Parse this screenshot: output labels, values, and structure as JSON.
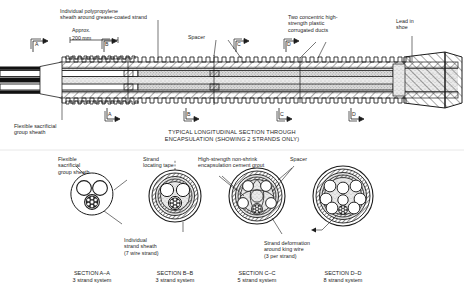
{
  "figure": {
    "title_line1": "TYPICAL LONGITUDINAL SECTION THROUGH",
    "title_line2": "ENCAPSULATION (SHOWING 2 STRANDS ONLY)"
  },
  "dimension": {
    "approx": "Approx.",
    "value": "200 mm"
  },
  "callouts_top": [
    {
      "id": "individual-polypropylene-sheath",
      "line1": "Individual polypropylene",
      "line2": "sheath around grease-coated strand"
    },
    {
      "id": "spacer",
      "line1": "Spacer",
      "line2": ""
    },
    {
      "id": "concentric-ducts",
      "line1": "Two concentric high-",
      "line2": "strength plastic",
      "line3": "corrugated ducts"
    },
    {
      "id": "lead-in-shoe",
      "line1": "Lead in",
      "line2": "shoe"
    }
  ],
  "callouts_bottom": [
    {
      "id": "flexible-sacrificial-group-sheath",
      "line1": "Flexible sacrificial",
      "line2": "group sheath"
    }
  ],
  "section_markers": [
    {
      "id": "A",
      "label": "A"
    },
    {
      "id": "B",
      "label": "B"
    },
    {
      "id": "C",
      "label": "C"
    },
    {
      "id": "D",
      "label": "D"
    }
  ],
  "detail_callouts": [
    {
      "id": "flexible-sacrificial-group-sheath-detail",
      "line1": "Flexible",
      "line2": "sacrificial",
      "line3": "group sheath"
    },
    {
      "id": "strand-locating-tape",
      "line1": "Strand",
      "line2": "locating tape",
      "line3": ""
    },
    {
      "id": "encapsulation-cement-grout",
      "line1": "High-strength non-shrink",
      "line2": "encapsulation cement grout",
      "line3": ""
    },
    {
      "id": "spacer-detail",
      "line1": "Spacer",
      "line2": "",
      "line3": ""
    },
    {
      "id": "individual-strand-sheath",
      "line1": "Individual",
      "line2": "strand sheath",
      "line3": "(7 wire strand)"
    },
    {
      "id": "strand-deformation",
      "line1": "Strand deformation",
      "line2": "around king wire",
      "line3": "(3 per strand)"
    }
  ],
  "sections": [
    {
      "id": "section-a-a",
      "name": "SECTION A–A",
      "system": "3 strand system",
      "strands": 3,
      "cx": 92,
      "r": 21
    },
    {
      "id": "section-b-b",
      "name": "SECTION B–B",
      "system": "3 strand system",
      "strands": 3,
      "cx": 175,
      "r": 26
    },
    {
      "id": "section-c-c",
      "name": "SECTION C–C",
      "system": "5 strand system",
      "strands": 5,
      "cx": 257,
      "r": 28
    },
    {
      "id": "section-d-d",
      "name": "SECTION D–D",
      "system": "8 strand system",
      "strands": 8,
      "cx": 343,
      "r": 30
    }
  ],
  "colors": {
    "ink": "#1c1c1c",
    "paper": "#ffffff",
    "grout": "#d8d8d8",
    "hatch": "#2a2a2a"
  }
}
